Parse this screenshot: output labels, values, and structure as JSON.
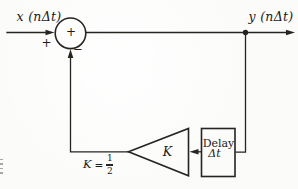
{
  "figure": {
    "type": "signal-flow block diagram (first-order recursive digital filter)",
    "input_label": "x (nΔt)",
    "output_label": "y (nΔt)",
    "summer_center_sign": "+",
    "summer_input_sign": "+",
    "summer_feedback_sign": "−",
    "delay_line1": "Delay",
    "delay_line2": "Δt",
    "gain_label": "K",
    "equation_lhs": "K",
    "equation_relation": "=",
    "equation_numerator": "1",
    "equation_denominator": "2",
    "ink_color": "#262421",
    "paper_color": "#fbfbfa"
  }
}
